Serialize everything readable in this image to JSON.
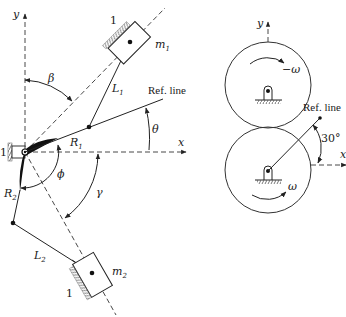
{
  "figure": {
    "left_diagram": {
      "axes": {
        "x_label": "x",
        "y_label": "y"
      },
      "masses": [
        {
          "name": "m",
          "sub": "1",
          "ground_label": "1"
        },
        {
          "name": "m",
          "sub": "2",
          "ground_label": "1"
        }
      ],
      "links": [
        {
          "name": "L",
          "sub": "1"
        },
        {
          "name": "L",
          "sub": "2"
        },
        {
          "name": "R",
          "sub": "1"
        },
        {
          "name": "R",
          "sub": "2"
        }
      ],
      "angles": {
        "beta": "β",
        "theta": "θ",
        "phi": "ϕ",
        "gamma": "γ"
      },
      "ref_line_label": "Ref. line",
      "pivot_ground_label": "1"
    },
    "right_diagram": {
      "axes": {
        "x_label": "x",
        "y_label": "y"
      },
      "top_gear": {
        "omega_label": "−ω"
      },
      "bottom_gear": {
        "omega_label": "ω"
      },
      "ref_line_label": "Ref. line",
      "angle_label": "30°"
    },
    "colors": {
      "ink": "#1a1a1a",
      "background": "#ffffff"
    }
  }
}
